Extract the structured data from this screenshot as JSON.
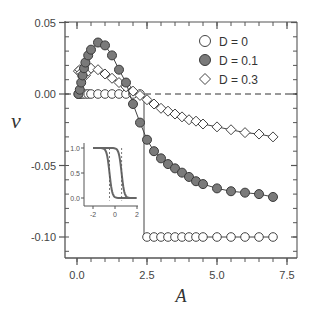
{
  "chart_data": {
    "type": "line",
    "title": "",
    "xlabel": "A",
    "ylabel": "v",
    "xlim": [
      -0.4,
      7.9
    ],
    "ylim": [
      -0.12,
      0.052
    ],
    "xticks": [
      0.0,
      2.5,
      5.0,
      7.5
    ],
    "xtick_labels": [
      "0.0",
      "2.5",
      "5.0",
      "7.5"
    ],
    "yticks": [
      0.05,
      0.0,
      -0.05,
      -0.1
    ],
    "ytick_labels": [
      "0.05",
      "0.00",
      "-0.05",
      "-0.10"
    ],
    "grid": false,
    "reference_line": {
      "y": 0.0,
      "style": "dashed"
    },
    "legend": {
      "position": "upper right",
      "entries": [
        "D = 0",
        "D = 0.1",
        "D = 0.3"
      ]
    },
    "series": [
      {
        "name": "D = 0",
        "marker": "open-circle",
        "x": [
          0.05,
          0.1,
          0.15,
          0.2,
          0.3,
          0.4,
          0.5,
          0.75,
          1.0,
          1.25,
          1.5,
          1.75,
          2.0,
          2.25,
          2.5,
          2.75,
          3.0,
          3.25,
          3.5,
          3.75,
          4.0,
          4.25,
          4.5,
          5.0,
          5.5,
          6.0,
          6.5,
          7.0
        ],
        "y": [
          0,
          0,
          0,
          0,
          0,
          0,
          0,
          0,
          0,
          0,
          0,
          0,
          0,
          0,
          -0.1,
          -0.1,
          -0.1,
          -0.1,
          -0.1,
          -0.1,
          -0.1,
          -0.1,
          -0.1,
          -0.1,
          -0.1,
          -0.1,
          -0.1,
          -0.1
        ]
      },
      {
        "name": "D = 0.1",
        "marker": "filled-circle",
        "x": [
          0.05,
          0.1,
          0.15,
          0.2,
          0.25,
          0.3,
          0.4,
          0.5,
          0.75,
          1.0,
          1.25,
          1.5,
          1.75,
          2.0,
          2.25,
          2.5,
          2.75,
          3.0,
          3.25,
          3.5,
          3.75,
          4.0,
          4.25,
          4.5,
          5.0,
          5.5,
          6.0,
          6.5,
          7.0
        ],
        "y": [
          0.0,
          0.003,
          0.008,
          0.013,
          0.018,
          0.022,
          0.027,
          0.031,
          0.036,
          0.034,
          0.027,
          0.017,
          0.008,
          -0.007,
          -0.02,
          -0.032,
          -0.04,
          -0.045,
          -0.049,
          -0.052,
          -0.055,
          -0.058,
          -0.061,
          -0.063,
          -0.066,
          -0.068,
          -0.069,
          -0.07,
          -0.072
        ]
      },
      {
        "name": "D = 0.3",
        "marker": "open-diamond",
        "x": [
          0.05,
          0.1,
          0.15,
          0.2,
          0.3,
          0.4,
          0.5,
          0.75,
          1.0,
          1.25,
          1.5,
          1.75,
          2.0,
          2.25,
          2.5,
          2.75,
          3.0,
          3.25,
          3.5,
          3.75,
          4.0,
          4.25,
          4.5,
          5.0,
          5.5,
          6.0,
          6.5,
          7.0
        ],
        "y": [
          0.016,
          0.017,
          0.015,
          0.012,
          0.013,
          0.016,
          0.018,
          0.017,
          0.014,
          0.011,
          0.008,
          0.005,
          0.002,
          -0.001,
          -0.004,
          -0.007,
          -0.01,
          -0.012,
          -0.014,
          -0.016,
          -0.018,
          -0.019,
          -0.021,
          -0.023,
          -0.025,
          -0.027,
          -0.028,
          -0.03
        ]
      }
    ],
    "inset": {
      "type": "line",
      "xlim": [
        -2.6,
        2.3
      ],
      "ylim": [
        -0.1,
        1.1
      ],
      "xticks": [
        -2,
        0,
        2
      ],
      "xtick_labels": [
        "-2",
        "0",
        "2"
      ],
      "yticks": [
        0.0,
        0.5,
        1.0
      ],
      "ytick_labels": [
        "0.0",
        "0.5",
        "1.0"
      ],
      "series": [
        {
          "name": "left-front",
          "center": -0.5,
          "steepness": 8
        },
        {
          "name": "right-front",
          "center": 0.6,
          "steepness": 8
        }
      ]
    }
  }
}
